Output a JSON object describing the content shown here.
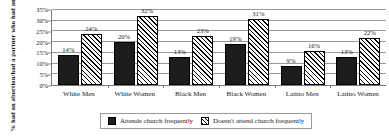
{
  "chart_data": {
    "type": "bar",
    "title": "",
    "xlabel": "",
    "ylabel": "% had an abortion/had a partner who had an abortion",
    "ylim": [
      0,
      35
    ],
    "ytick_labels": [
      "0%",
      "5%",
      "10%",
      "15%",
      "20%",
      "25%",
      "30%",
      "35%"
    ],
    "yticks": [
      0,
      5,
      10,
      15,
      20,
      25,
      30,
      35
    ],
    "grid": true,
    "legend_position": "bottom",
    "categories": [
      "White Men",
      "White Women",
      "Black Men",
      "Black Women",
      "Latino Men",
      "Latino Women"
    ],
    "series": [
      {
        "name": "Attends church frequently",
        "pattern": "solid",
        "color": "#1c1c1c",
        "values": [
          14,
          20,
          13,
          19,
          9,
          13
        ],
        "value_labels": [
          "14%",
          "20%",
          "13%",
          "19%",
          "9%",
          "13%"
        ]
      },
      {
        "name": "Doesn't attend church frequently",
        "pattern": "diagonal-hatch",
        "color": "#ffffff",
        "values": [
          24,
          32,
          23,
          31,
          16,
          22
        ],
        "value_labels": [
          "24%",
          "32%",
          "23%",
          "31%",
          "16%",
          "22%"
        ]
      }
    ]
  },
  "legend": {
    "items": [
      {
        "label": "Attends church frequently"
      },
      {
        "label": "Doesn't attend church frequently"
      }
    ]
  },
  "colors": {
    "series_solid": "#1c1c1c",
    "series_hatch_line": "#000000",
    "gridline": "#9a9a9a",
    "axis": "#7a7a7a",
    "text": "#1a1a1a",
    "background": "#ffffff"
  }
}
